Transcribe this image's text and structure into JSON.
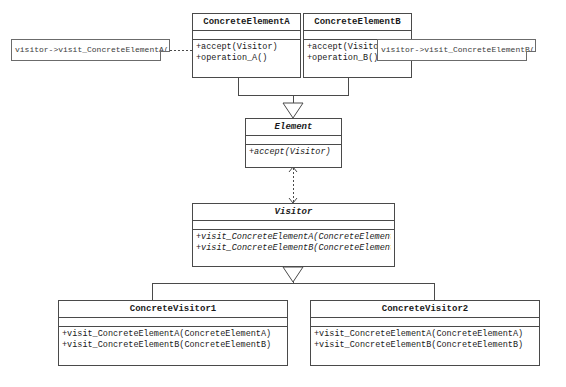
{
  "diagram": {
    "line_color": "#4a4a4a",
    "note_border_color": "#6b6b6b",
    "background_color": "#ffffff",
    "text_color": "#1a1a1a"
  },
  "notes": [
    {
      "id": "note-a",
      "text": "visitor->visit_ConcreteElementA(this)"
    },
    {
      "id": "note-b",
      "text": "visitor->visit_ConcreteElementB(this)"
    }
  ],
  "classes": {
    "concrete_element_a": {
      "name": "ConcreteElementA",
      "abstract": false,
      "members": [
        {
          "text": "+accept(Visitor)",
          "abstract": false
        },
        {
          "text": "+operation_A()",
          "abstract": false
        }
      ]
    },
    "concrete_element_b": {
      "name": "ConcreteElementB",
      "abstract": false,
      "members": [
        {
          "text": "+accept(Visitor)",
          "abstract": false
        },
        {
          "text": "+operation_B()",
          "abstract": false
        }
      ]
    },
    "element": {
      "name": "Element",
      "abstract": true,
      "members": [
        {
          "text": "+accept(Visitor)",
          "abstract": true
        }
      ]
    },
    "visitor": {
      "name": "Visitor",
      "abstract": true,
      "members": [
        {
          "text": "+visit_ConcreteElementA(ConcreteElementA)",
          "abstract": true
        },
        {
          "text": "+visit_ConcreteElementB(ConcreteElementB)",
          "abstract": true
        }
      ]
    },
    "concrete_visitor_1": {
      "name": "ConcreteVisitor1",
      "abstract": false,
      "members": [
        {
          "text": "+visit_ConcreteElementA(ConcreteElementA)",
          "abstract": false
        },
        {
          "text": "+visit_ConcreteElementB(ConcreteElementB)",
          "abstract": false
        }
      ]
    },
    "concrete_visitor_2": {
      "name": "ConcreteVisitor2",
      "abstract": false,
      "members": [
        {
          "text": "+visit_ConcreteElementA(ConcreteElementA)",
          "abstract": false
        },
        {
          "text": "+visit_ConcreteElementB(ConcreteElementB)",
          "abstract": false
        }
      ]
    }
  },
  "relationships": [
    {
      "id": "gen-element-a",
      "type": "generalization",
      "from": "ConcreteElementA",
      "to": "Element"
    },
    {
      "id": "gen-element-b",
      "type": "generalization",
      "from": "ConcreteElementB",
      "to": "Element"
    },
    {
      "id": "dep-element-visitor",
      "type": "dependency",
      "from": "Element",
      "to": "Visitor"
    },
    {
      "id": "gen-visitor-1",
      "type": "generalization",
      "from": "ConcreteVisitor1",
      "to": "Visitor"
    },
    {
      "id": "gen-visitor-2",
      "type": "generalization",
      "from": "ConcreteVisitor2",
      "to": "Visitor"
    },
    {
      "id": "anchor-note-a",
      "type": "note-anchor",
      "from": "note-a",
      "to": "ConcreteElementA"
    },
    {
      "id": "anchor-note-b",
      "type": "note-anchor",
      "from": "note-b",
      "to": "ConcreteElementB"
    }
  ]
}
